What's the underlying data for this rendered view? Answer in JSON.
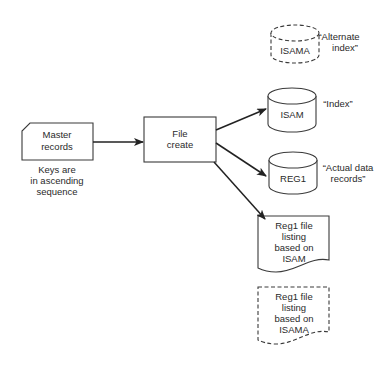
{
  "diagram": {
    "type": "flowchart",
    "nodes": {
      "master": {
        "lines": [
          "Master",
          "records"
        ],
        "shape": "card"
      },
      "master_note": {
        "lines": [
          "Keys are",
          "in ascending",
          "sequence"
        ]
      },
      "file_create": {
        "lines": [
          "File",
          "create"
        ],
        "shape": "process"
      },
      "isama": {
        "label": "ISAMA",
        "shape": "disk-dashed",
        "caption": [
          "“Alternate",
          "index”"
        ]
      },
      "isam": {
        "label": "ISAM",
        "shape": "disk",
        "caption": [
          "“Index”"
        ]
      },
      "reg1": {
        "label": "REG1",
        "shape": "disk",
        "caption": [
          "“Actual data",
          "records”"
        ]
      },
      "listing_isam": {
        "lines": [
          "Reg1 file",
          "listing",
          "based on",
          "ISAM"
        ],
        "shape": "document"
      },
      "listing_isama": {
        "lines": [
          "Reg1 file",
          "listing",
          "based on",
          "ISAMA"
        ],
        "shape": "document-dashed"
      }
    },
    "edges": [
      {
        "from": "master",
        "to": "file_create"
      },
      {
        "from": "file_create",
        "to": "isam"
      },
      {
        "from": "file_create",
        "to": "reg1"
      },
      {
        "from": "file_create",
        "to": "listing_isam"
      }
    ],
    "colors": {
      "stroke": "#3a3a3a",
      "text": "#2a2a2a",
      "background": "#ffffff"
    }
  }
}
